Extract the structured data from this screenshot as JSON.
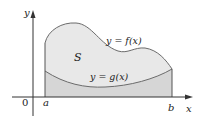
{
  "diagram": {
    "type": "area-between-curves",
    "labels": {
      "y_axis": "y",
      "x_axis": "x",
      "origin": "0",
      "left_bound": "a",
      "right_bound": "b",
      "region": "S",
      "upper_curve": "y = f(x)",
      "lower_curve": "y = g(x)"
    },
    "colors": {
      "region_fill": "#e6e6e6",
      "under_g_fill": "#d4d4d4",
      "curve_stroke": "#6b6b6b",
      "axis_stroke": "#333333"
    }
  }
}
